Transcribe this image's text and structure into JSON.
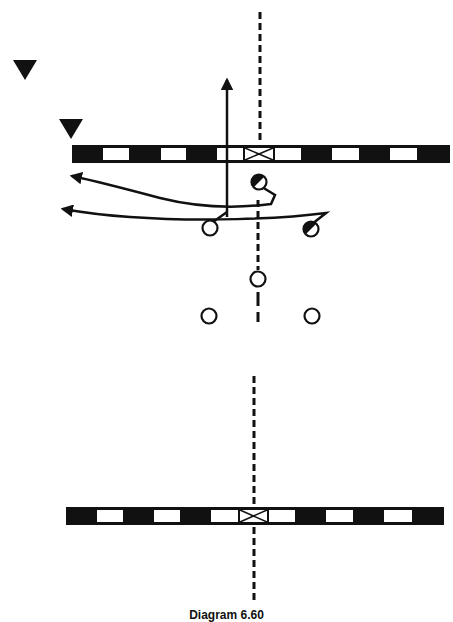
{
  "diagram": {
    "caption": "Diagram 6.60",
    "colors": {
      "ink": "#111111",
      "paper": "#ffffff"
    },
    "top_field": {
      "line_of_scrimmage": {
        "x": 72,
        "y": 145,
        "width": 378,
        "height": 18,
        "segments": [
          {
            "x": 72,
            "w": 30,
            "fill": "black"
          },
          {
            "x": 102,
            "w": 28,
            "fill": "white"
          },
          {
            "x": 130,
            "w": 30,
            "fill": "black"
          },
          {
            "x": 160,
            "w": 27,
            "fill": "white"
          },
          {
            "x": 187,
            "w": 29,
            "fill": "black"
          },
          {
            "x": 216,
            "w": 28,
            "fill": "white"
          },
          {
            "x": 244,
            "w": 30,
            "fill": "center-x"
          },
          {
            "x": 274,
            "w": 28,
            "fill": "white"
          },
          {
            "x": 302,
            "w": 29,
            "fill": "black"
          },
          {
            "x": 331,
            "w": 29,
            "fill": "white"
          },
          {
            "x": 360,
            "w": 29,
            "fill": "black"
          },
          {
            "x": 389,
            "w": 29,
            "fill": "white"
          },
          {
            "x": 418,
            "w": 32,
            "fill": "black"
          }
        ]
      },
      "defenders": [
        {
          "label": "defender-1",
          "x": 25,
          "y": 68
        },
        {
          "label": "defender-2",
          "x": 71,
          "y": 128
        }
      ],
      "players": [
        {
          "label": "player-ball-top",
          "x": 259,
          "y": 182,
          "type": "half-filled"
        },
        {
          "label": "player-left-wing",
          "x": 210,
          "y": 228,
          "type": "open"
        },
        {
          "label": "player-right-wing",
          "x": 311,
          "y": 229,
          "type": "half-filled"
        },
        {
          "label": "player-center-mid",
          "x": 258,
          "y": 279,
          "type": "open"
        },
        {
          "label": "player-back-left",
          "x": 209,
          "y": 316,
          "type": "open"
        },
        {
          "label": "player-back-right",
          "x": 312,
          "y": 316,
          "type": "open"
        }
      ]
    },
    "bottom_field": {
      "line_of_scrimmage": {
        "x": 66,
        "y": 507,
        "width": 378,
        "height": 18,
        "segments": [
          {
            "x": 66,
            "w": 30,
            "fill": "black"
          },
          {
            "x": 96,
            "w": 28,
            "fill": "white"
          },
          {
            "x": 124,
            "w": 29,
            "fill": "black"
          },
          {
            "x": 153,
            "w": 28,
            "fill": "white"
          },
          {
            "x": 181,
            "w": 29,
            "fill": "black"
          },
          {
            "x": 210,
            "w": 29,
            "fill": "white"
          },
          {
            "x": 239,
            "w": 29,
            "fill": "center-x"
          },
          {
            "x": 268,
            "w": 28,
            "fill": "white"
          },
          {
            "x": 296,
            "w": 29,
            "fill": "black"
          },
          {
            "x": 325,
            "w": 29,
            "fill": "white"
          },
          {
            "x": 354,
            "w": 29,
            "fill": "black"
          },
          {
            "x": 383,
            "w": 30,
            "fill": "white"
          },
          {
            "x": 413,
            "w": 31,
            "fill": "black"
          }
        ]
      }
    }
  }
}
